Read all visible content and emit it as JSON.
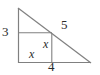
{
  "figure": {
    "kind": "right-triangle-with-inscribed-square",
    "stroke_color": "#808080",
    "label_color": "#2b2b2b",
    "background_color": "#ffffff",
    "labels": {
      "left_leg": "3",
      "hypotenuse": "5",
      "base_segment": "4",
      "square_vertical_side": "x",
      "square_horizontal_side": "x"
    },
    "geometry": {
      "apex": [
        18,
        8
      ],
      "right_angle_corner": [
        18,
        63
      ],
      "base_end": [
        91,
        63
      ],
      "square_top_left": [
        18,
        33
      ],
      "square_top_right": [
        52,
        33
      ],
      "square_bottom_right": [
        52,
        63
      ]
    }
  }
}
